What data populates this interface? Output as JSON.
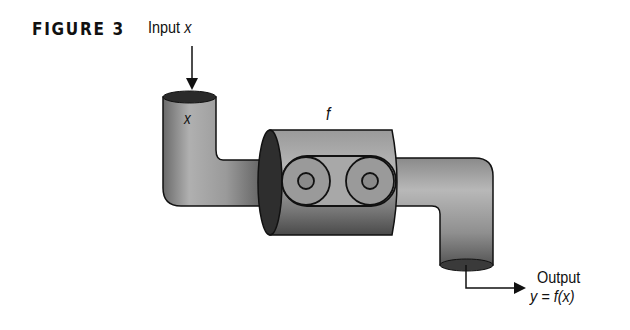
{
  "figure": {
    "label": "FIGURE 3",
    "input_label_text": "Input",
    "input_label_var": "x",
    "pipe_input_var": "x",
    "machine_label": "f",
    "output_label": "Output",
    "output_formula": "y = f(x)"
  },
  "diagram": {
    "components": [
      {
        "id": "input-pipe",
        "description": "L-shaped pipe receiving input x"
      },
      {
        "id": "function-machine",
        "description": "cylindrical machine f with two rollers"
      },
      {
        "id": "output-pipe",
        "description": "L-shaped pipe emitting output y = f(x)"
      }
    ],
    "arrows": [
      {
        "from": "Input x",
        "to": "input-pipe",
        "direction": "down"
      },
      {
        "from": "output-pipe",
        "to": "Output y = f(x)",
        "direction": "down-right"
      }
    ]
  }
}
